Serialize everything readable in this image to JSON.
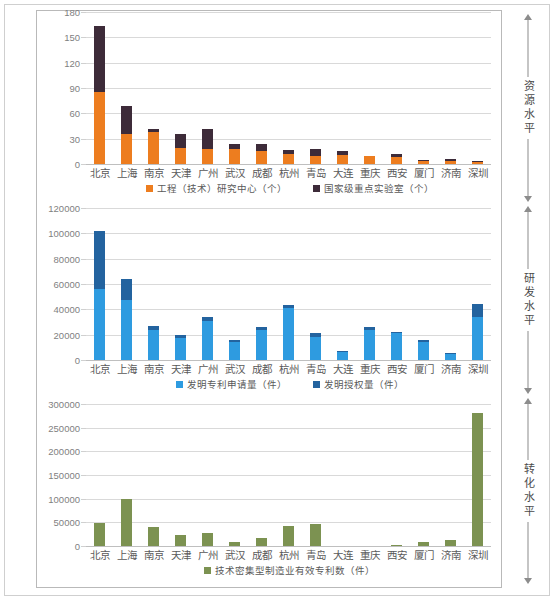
{
  "side_annotations": [
    {
      "label": "资源水平"
    },
    {
      "label": "研发水平"
    },
    {
      "label": "转化水平"
    }
  ],
  "colors": {
    "orange": "#ED7D1F",
    "dark_purple": "#3D2B39",
    "light_blue": "#2E9BE0",
    "dark_blue": "#23639F",
    "green": "#7C9251",
    "gridline": "#D9D9D9",
    "axis_text": "#7F7F7F"
  },
  "chart_data": [
    {
      "type": "bar",
      "stacked": true,
      "title": "",
      "xlabel": "",
      "ylabel": "",
      "ylim": [
        0,
        180
      ],
      "yticks": [
        0,
        30,
        60,
        90,
        120,
        150,
        180
      ],
      "grid": true,
      "legend_position": "bottom",
      "categories": [
        "北京",
        "上海",
        "南京",
        "天津",
        "广州",
        "武汉",
        "成都",
        "杭州",
        "青岛",
        "大连",
        "重庆",
        "西安",
        "厦门",
        "济南",
        "深圳"
      ],
      "series": [
        {
          "name": "工程（技术）研究中心（个）",
          "color": "#ED7D1F",
          "values": [
            85,
            36,
            38,
            19,
            18,
            18,
            15,
            12,
            10,
            11,
            10,
            8,
            4,
            4,
            2
          ]
        },
        {
          "name": "国家级重点实验室（个）",
          "color": "#3D2B39",
          "values": [
            78,
            33,
            4,
            16,
            24,
            6,
            9,
            5,
            8,
            4,
            0,
            4,
            1,
            2,
            1
          ]
        }
      ]
    },
    {
      "type": "bar",
      "stacked": true,
      "title": "",
      "xlabel": "",
      "ylabel": "",
      "ylim": [
        0,
        120000
      ],
      "yticks": [
        0,
        20000,
        40000,
        60000,
        80000,
        100000,
        120000
      ],
      "grid": true,
      "legend_position": "bottom",
      "categories": [
        "北京",
        "上海",
        "南京",
        "天津",
        "广州",
        "武汉",
        "成都",
        "杭州",
        "青岛",
        "大连",
        "重庆",
        "西安",
        "厦门",
        "济南",
        "深圳"
      ],
      "series": [
        {
          "name": "发明专利申请量（件）",
          "color": "#2E9BE0",
          "values": [
            56000,
            47000,
            24000,
            17500,
            31000,
            14000,
            23500,
            41000,
            18500,
            6500,
            23500,
            21000,
            14500,
            5000,
            34000
          ]
        },
        {
          "name": "发明授权量（件）",
          "color": "#23639F",
          "values": [
            45500,
            17000,
            2800,
            2300,
            2800,
            2000,
            2800,
            2300,
            2500,
            700,
            2500,
            1500,
            1500,
            700,
            10000
          ]
        }
      ]
    },
    {
      "type": "bar",
      "stacked": false,
      "title": "",
      "xlabel": "",
      "ylabel": "",
      "ylim": [
        0,
        300000
      ],
      "yticks": [
        0,
        50000,
        100000,
        150000,
        200000,
        250000,
        300000
      ],
      "grid": true,
      "legend_position": "bottom",
      "categories": [
        "北京",
        "上海",
        "南京",
        "天津",
        "广州",
        "武汉",
        "成都",
        "杭州",
        "青岛",
        "大连",
        "重庆",
        "西安",
        "厦门",
        "济南",
        "深圳"
      ],
      "series": [
        {
          "name": "技术密集型制造业有效专利数（件）",
          "color": "#7C9251",
          "values": [
            48000,
            99000,
            41000,
            24000,
            27000,
            8000,
            16000,
            42000,
            45500,
            0,
            0,
            3000,
            8500,
            13000,
            281000
          ]
        }
      ]
    }
  ]
}
